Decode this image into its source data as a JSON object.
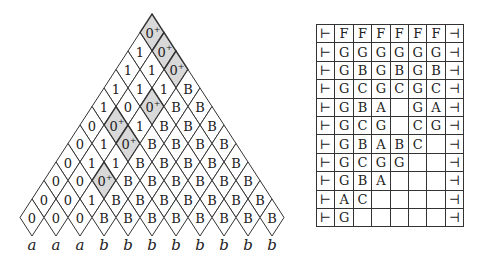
{
  "triangle": {
    "rows": [
      [
        "0+"
      ],
      [
        "1",
        "0+"
      ],
      [
        "1",
        "1",
        "0+"
      ],
      [
        "1",
        "1",
        "1",
        "B"
      ],
      [
        "1",
        "0",
        "0+",
        "B",
        "B"
      ],
      [
        "0",
        "0+",
        "1",
        "B",
        "B",
        "B"
      ],
      [
        "0",
        "1",
        "0+",
        "B",
        "B",
        "B",
        "B"
      ],
      [
        "0",
        "1",
        "1",
        "B",
        "B",
        "B",
        "B",
        "B"
      ],
      [
        "0",
        "0",
        "0+",
        "B",
        "B",
        "B",
        "B",
        "B",
        "B"
      ],
      [
        "0",
        "0",
        "1",
        "B",
        "B",
        "B",
        "B",
        "B",
        "B",
        "B"
      ],
      [
        "0",
        "0",
        "0",
        "B",
        "B",
        "B",
        "B",
        "B",
        "B",
        "B",
        "B"
      ]
    ],
    "shaded_value": "0+",
    "shade_color": "#d9d9d9",
    "line_color": "#333333",
    "bottom_labels": [
      "a",
      "a",
      "a",
      "b",
      "b",
      "b",
      "b",
      "b",
      "b",
      "b",
      "b"
    ]
  },
  "table": {
    "rows": [
      [
        "⊢",
        "F",
        "F",
        "F",
        "F",
        "F",
        "F",
        "⊣"
      ],
      [
        "⊢",
        "G",
        "G",
        "G",
        "G",
        "G",
        "G",
        "⊣"
      ],
      [
        "⊢",
        "G",
        "B",
        "G",
        "B",
        "G",
        "B",
        "⊣"
      ],
      [
        "⊢",
        "G",
        "C",
        "G",
        "C",
        "G",
        "C",
        "⊣"
      ],
      [
        "⊢",
        "G",
        "B",
        "A",
        "",
        "G",
        "A",
        "⊣"
      ],
      [
        "⊢",
        "G",
        "C",
        "G",
        "",
        "C",
        "G",
        "⊣"
      ],
      [
        "⊢",
        "G",
        "B",
        "A",
        "B",
        "C",
        "",
        "⊣"
      ],
      [
        "⊢",
        "G",
        "C",
        "G",
        "G",
        "",
        "",
        "⊣"
      ],
      [
        "⊢",
        "G",
        "B",
        "A",
        "",
        "",
        "",
        "⊣"
      ],
      [
        "⊢",
        "A",
        "C",
        "",
        "",
        "",
        "",
        "⊣"
      ],
      [
        "⊢",
        "G",
        "",
        "",
        "",
        "",
        "",
        "⊣"
      ]
    ]
  }
}
